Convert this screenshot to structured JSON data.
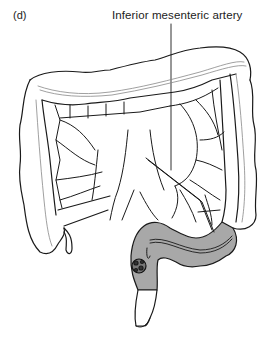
{
  "figure": {
    "panel_label": "(d)",
    "annotation": "Inferior mesenteric artery",
    "colors": {
      "line": "#1a1a1a",
      "shade": "#a8a8a8",
      "background": "#ffffff"
    }
  }
}
